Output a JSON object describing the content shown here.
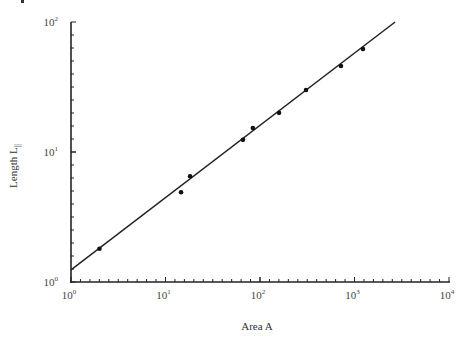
{
  "chart_data": {
    "type": "scatter",
    "title": "",
    "xlabel": "Area A",
    "ylabel": "Length L",
    "ylabel_subscript": "||",
    "xscale": "log",
    "yscale": "log",
    "xlim": [
      1,
      10000
    ],
    "ylim": [
      1,
      100
    ],
    "grid": false,
    "legend": null,
    "x_ticks": [
      {
        "base": "10",
        "exp": "0",
        "value": 1
      },
      {
        "base": "10",
        "exp": "1",
        "value": 10
      },
      {
        "base": "10",
        "exp": "2",
        "value": 100
      },
      {
        "base": "10",
        "exp": "3",
        "value": 1000
      },
      {
        "base": "10",
        "exp": "4",
        "value": 10000
      }
    ],
    "y_ticks": [
      {
        "base": "10",
        "exp": "0",
        "value": 1
      },
      {
        "base": "10",
        "exp": "1",
        "value": 10
      },
      {
        "base": "10",
        "exp": "2",
        "value": 100
      }
    ],
    "series": [
      {
        "name": "data",
        "kind": "points",
        "x": [
          2.0,
          14.6,
          18.2,
          66,
          84,
          159,
          307,
          719,
          1230
        ],
        "y": [
          1.8,
          4.9,
          6.5,
          12.4,
          15.3,
          20.0,
          30.0,
          45.9,
          62.0
        ]
      },
      {
        "name": "fit",
        "kind": "line",
        "x": [
          1,
          2690
        ],
        "y": [
          1.24,
          100
        ]
      }
    ]
  }
}
